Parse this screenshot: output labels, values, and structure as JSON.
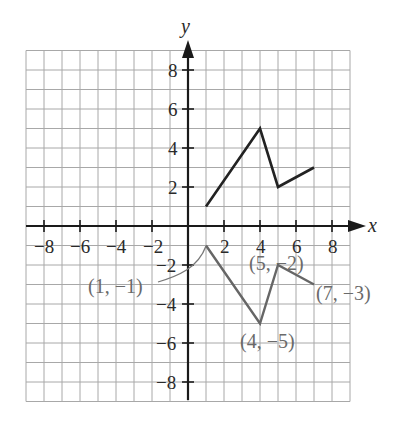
{
  "chart_data": {
    "type": "line",
    "title": "",
    "xlabel": "x",
    "ylabel": "y",
    "xlim": [
      -9,
      9
    ],
    "ylim": [
      -9,
      9
    ],
    "grid": true,
    "x_ticks": [
      -8,
      -6,
      -4,
      -2,
      2,
      4,
      6,
      8
    ],
    "y_ticks": [
      8,
      6,
      4,
      2,
      -2,
      -4,
      -6,
      -8
    ],
    "x_tick_labels": [
      "−8",
      "−6",
      "−4",
      "−2",
      "2",
      "4",
      "6",
      "8"
    ],
    "y_tick_labels": [
      "8",
      "6",
      "4",
      "2",
      "−2",
      "−4",
      "−6",
      "−8"
    ],
    "series": [
      {
        "name": "upper",
        "color": "#222222",
        "points": [
          [
            1,
            1
          ],
          [
            4,
            5
          ],
          [
            5,
            2
          ],
          [
            7,
            3
          ]
        ]
      },
      {
        "name": "lower",
        "color": "#666666",
        "points": [
          [
            1,
            -1
          ],
          [
            4,
            -5
          ],
          [
            5,
            -2
          ],
          [
            7,
            -3
          ]
        ]
      }
    ],
    "annotations": [
      {
        "text": "(1, −1)",
        "point": [
          1,
          -1
        ]
      },
      {
        "text": "(5, −2)",
        "point": [
          5,
          -2
        ]
      },
      {
        "text": "(7, −3)",
        "point": [
          7,
          -3
        ]
      },
      {
        "text": "(4, −5)",
        "point": [
          4,
          -5
        ]
      }
    ]
  },
  "labels": {
    "x_axis": "x",
    "y_axis": "y",
    "x_ticks": [
      "−8",
      "−6",
      "−4",
      "−2",
      "2",
      "4",
      "6",
      "8"
    ],
    "y_ticks": [
      "8",
      "6",
      "4",
      "2",
      "−2",
      "−4",
      "−6",
      "−8"
    ],
    "pt_1_m1": "(1, −1)",
    "pt_5_m2": "(5, −2)",
    "pt_7_m3": "(7, −3)",
    "pt_4_m5": "(4, −5)"
  }
}
